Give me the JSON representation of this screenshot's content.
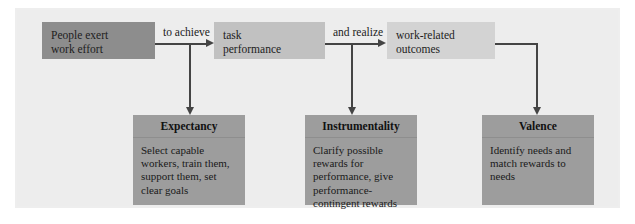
{
  "diagram": {
    "colors": {
      "panel_background": "#eeeeee",
      "box_effort": "#8d8d8d",
      "box_task": "#c1c1c1",
      "box_outcomes": "#d3d3d3",
      "box_concept": "#9d9d9d",
      "connector": "#444444",
      "text": "#1a1a1a"
    },
    "process_boxes": [
      {
        "id": "effort",
        "lines": [
          "People exert",
          "work effort"
        ]
      },
      {
        "id": "task",
        "lines": [
          "task",
          "performance"
        ]
      },
      {
        "id": "outcomes",
        "lines": [
          "work-related",
          "outcomes"
        ]
      }
    ],
    "connector_labels": [
      {
        "id": "to-achieve",
        "text": "to achieve"
      },
      {
        "id": "and-realize",
        "text": "and realize"
      }
    ],
    "concept_boxes": [
      {
        "id": "expectancy",
        "title": "Expectancy",
        "lines": [
          "Select capable",
          "workers, train them,",
          "support them, set",
          "clear goals"
        ]
      },
      {
        "id": "instrumentality",
        "title": "Instrumentality",
        "lines": [
          "Clarify possible",
          "rewards for",
          "performance, give",
          "performance-",
          "contingent rewards"
        ]
      },
      {
        "id": "valence",
        "title": "Valence",
        "lines": [
          "Identify needs and",
          "match rewards to",
          "needs"
        ]
      }
    ]
  }
}
